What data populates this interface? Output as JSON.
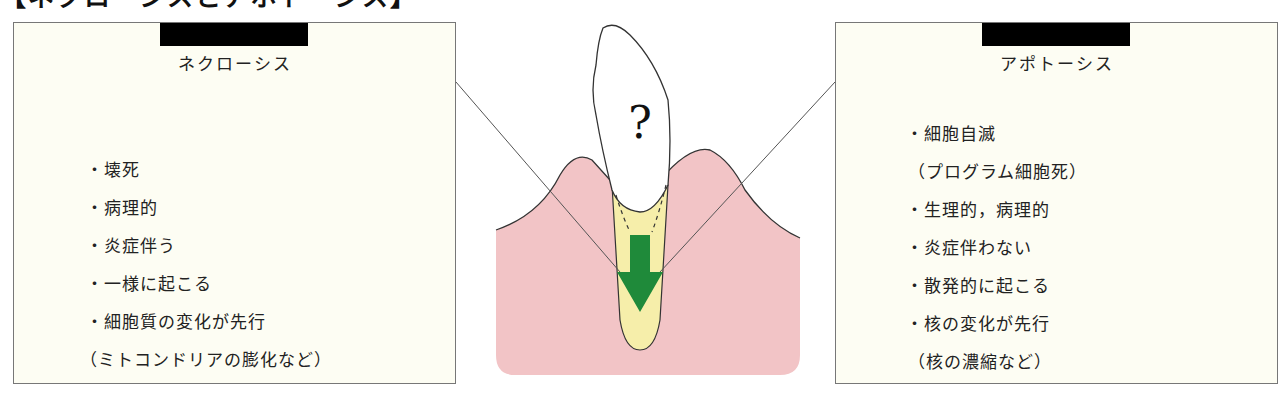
{
  "heading": "【ネクローシスとアポトーシス】",
  "left_panel": {
    "title": "ネクローシス",
    "items": [
      {
        "text": "・壊死",
        "type": "bullet"
      },
      {
        "text": "・病理的",
        "type": "bullet"
      },
      {
        "text": "・炎症伴う",
        "type": "bullet"
      },
      {
        "text": "・一様に起こる",
        "type": "bullet"
      },
      {
        "text": "・細胞質の変化が先行",
        "type": "bullet"
      },
      {
        "text": "（ミトコンドリアの膨化など）",
        "type": "sub"
      }
    ]
  },
  "right_panel": {
    "title": "アポトーシス",
    "items": [
      {
        "text": "・細胞自滅",
        "type": "bullet"
      },
      {
        "text": "（プログラム細胞死）",
        "type": "sub"
      },
      {
        "text": "・生理的，病理的",
        "type": "bullet"
      },
      {
        "text": "・炎症伴わない",
        "type": "bullet"
      },
      {
        "text": "・散発的に起こる",
        "type": "bullet"
      },
      {
        "text": "・核の変化が先行",
        "type": "bullet"
      },
      {
        "text": "（核の濃縮など）",
        "type": "sub"
      }
    ]
  },
  "diagram": {
    "tooth_label": "?",
    "colors": {
      "gum": "#f2c4c6",
      "tooth": "#ffffff",
      "root": "#f6eeaa",
      "arrow": "#1f8a3a",
      "outline": "#333333",
      "panel_bg": "#fdfdf3",
      "redaction": "#000000"
    }
  }
}
